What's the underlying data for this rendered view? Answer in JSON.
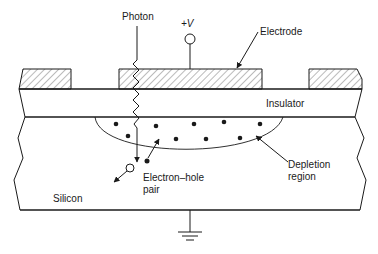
{
  "diagram": {
    "labels": {
      "photon": "Photon",
      "voltage": "+V",
      "electrode": "Electrode",
      "insulator": "Insulator",
      "depletion_line1": "Depletion",
      "depletion_line2": "region",
      "pair_line1": "Electron–hole",
      "pair_line2": "pair",
      "silicon": "Silicon"
    },
    "colors": {
      "line": "#1a1a1a",
      "hatch": "#555555",
      "background": "#ffffff"
    }
  }
}
